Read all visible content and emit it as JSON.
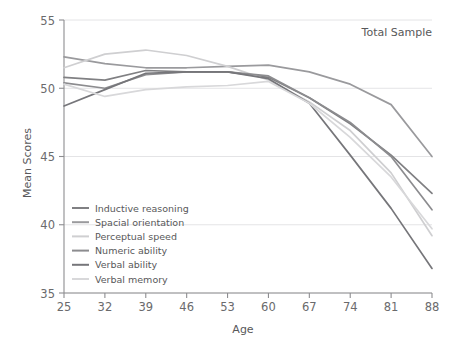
{
  "chart_data": {
    "type": "line",
    "title": "",
    "annotation": "Total Sample",
    "xlabel": "Age",
    "ylabel": "Mean Scores",
    "categories": [
      25,
      32,
      39,
      46,
      53,
      60,
      67,
      74,
      81,
      88
    ],
    "x": [
      25,
      32,
      39,
      46,
      53,
      60,
      67,
      74,
      81,
      88
    ],
    "xlim": [
      25,
      88
    ],
    "ylim": [
      35,
      55
    ],
    "yticks": [
      35,
      40,
      45,
      50,
      55
    ],
    "xticks": [
      25,
      32,
      39,
      46,
      53,
      60,
      67,
      74,
      81,
      88
    ],
    "grid": "horizontal",
    "legend_position": "bottom-left",
    "series": [
      {
        "name": "Inductive reasoning",
        "color": "#808083",
        "values": [
          50.8,
          50.6,
          51.3,
          51.2,
          51.2,
          50.8,
          49.3,
          47.4,
          45.1,
          42.3
        ]
      },
      {
        "name": "Spacial orientation",
        "color": "#9a9a9d",
        "values": [
          52.3,
          51.8,
          51.5,
          51.5,
          51.6,
          51.7,
          51.2,
          50.3,
          48.8,
          45.0
        ]
      },
      {
        "name": "Perceptual speed",
        "color": "#cfcfd1",
        "values": [
          51.5,
          52.5,
          52.8,
          52.4,
          51.6,
          50.6,
          49.0,
          46.9,
          43.8,
          39.2
        ]
      },
      {
        "name": "Numeric ability",
        "color": "#8c8c8f",
        "values": [
          50.4,
          50.0,
          51.0,
          51.2,
          51.2,
          50.9,
          49.3,
          47.5,
          45.0,
          41.1
        ]
      },
      {
        "name": "Verbal ability",
        "color": "#76767a",
        "values": [
          48.7,
          49.9,
          51.1,
          51.2,
          51.2,
          50.7,
          48.9,
          45.1,
          41.2,
          36.8
        ]
      },
      {
        "name": "Verbal memory",
        "color": "#d8d8da",
        "values": [
          50.3,
          49.4,
          49.9,
          50.1,
          50.2,
          50.5,
          48.9,
          46.4,
          43.5,
          39.7
        ]
      }
    ]
  },
  "axes": {
    "y_title": "Mean Scores",
    "x_title": "Age",
    "y_tick_labels": [
      "55",
      "50",
      "45",
      "40",
      "35"
    ],
    "x_tick_labels": [
      "25",
      "32",
      "39",
      "46",
      "53",
      "60",
      "67",
      "74",
      "81",
      "88"
    ]
  },
  "annotation": {
    "text": "Total Sample"
  },
  "legend": {
    "items": [
      {
        "label": "Inductive reasoning",
        "color": "#808083"
      },
      {
        "label": "Spacial orientation",
        "color": "#9a9a9d"
      },
      {
        "label": "Perceptual speed",
        "color": "#cfcfd1"
      },
      {
        "label": "Numeric ability",
        "color": "#8c8c8f"
      },
      {
        "label": "Verbal ability",
        "color": "#76767a"
      },
      {
        "label": "Verbal memory",
        "color": "#d8d8da"
      }
    ]
  },
  "colors": {
    "background": "#ffffff",
    "axis": "#8d8d90",
    "grid": "#e4e4e6",
    "text": "#58585a"
  }
}
